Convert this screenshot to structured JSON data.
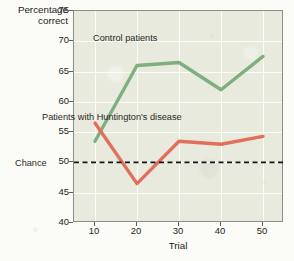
{
  "chart_data": {
    "type": "line",
    "title": "",
    "xlabel": "Trial",
    "ylabel": "Percentage correct",
    "xlim": [
      5,
      55
    ],
    "ylim": [
      40,
      75
    ],
    "grid": true,
    "legend_position": "inline-annotations",
    "x": [
      10,
      20,
      30,
      40,
      50
    ],
    "xticks": [
      "10",
      "20",
      "30",
      "40",
      "50"
    ],
    "yticks": [
      "40",
      "45",
      "50",
      "55",
      "60",
      "65",
      "70",
      "75"
    ],
    "series": [
      {
        "name": "Control patients",
        "color": "#7fae7f",
        "values": [
          53.5,
          66.0,
          66.5,
          62.0,
          67.5
        ]
      },
      {
        "name": "Patients with Huntington's disease",
        "color": "#e0705c",
        "values": [
          56.5,
          46.5,
          53.5,
          53.0,
          54.3
        ]
      }
    ],
    "reference_lines": [
      {
        "name": "Chance",
        "value": 50,
        "style": "dashed",
        "color": "#141414"
      }
    ],
    "annotations": [
      {
        "text": "Control patients",
        "series": "Control patients"
      },
      {
        "text": "Patients with Huntington's disease",
        "series": "Patients with Huntington's disease"
      },
      {
        "text": "Chance",
        "series": "Chance"
      }
    ]
  },
  "axes": {
    "y_title_line1": "Percentage",
    "y_title_line2": "correct",
    "x_title": "Trial"
  },
  "colors": {
    "plot_background": "#e9eade",
    "gridline": "#fdfdf8",
    "control_line": "#7fae7f",
    "huntington_line": "#e0705c",
    "chance_line": "#141414",
    "axis": "#8d8d86",
    "text": "#1d1c1a"
  }
}
